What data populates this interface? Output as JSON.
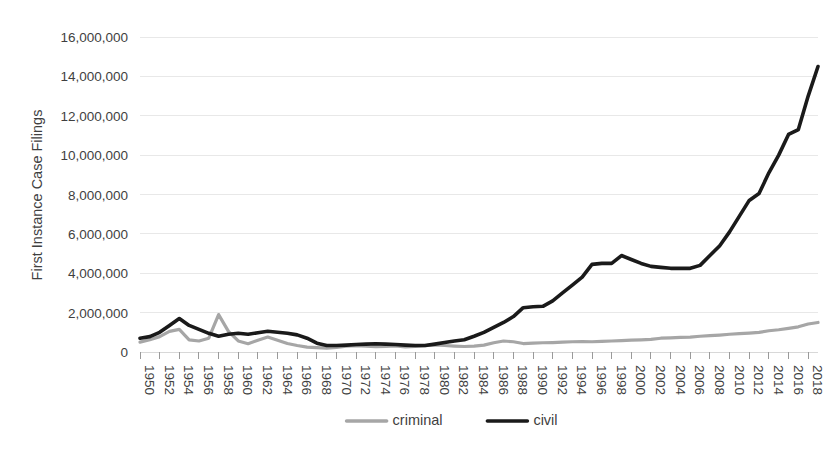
{
  "chart_data": {
    "type": "line",
    "title": "",
    "xlabel": "",
    "ylabel": "First Instance Case Filings",
    "ylim": [
      0,
      16000000
    ],
    "xlim": [
      1950,
      2019
    ],
    "grid": true,
    "legend_position": "bottom",
    "y_ticks": [
      0,
      2000000,
      4000000,
      6000000,
      8000000,
      10000000,
      12000000,
      14000000,
      16000000
    ],
    "y_tick_labels": [
      "0",
      "2,000,000",
      "4,000,000",
      "6,000,000",
      "8,000,000",
      "10,000,000",
      "12,000,000",
      "14,000,000",
      "16,000,000"
    ],
    "x_tick_labels": [
      "1950",
      "1952",
      "1954",
      "1956",
      "1958",
      "1960",
      "1962",
      "1964",
      "1966",
      "1968",
      "1970",
      "1972",
      "1974",
      "1976",
      "1978",
      "1980",
      "1982",
      "1984",
      "1986",
      "1988",
      "1990",
      "1992",
      "1994",
      "1996",
      "1998",
      "2000",
      "2002",
      "2004",
      "2006",
      "2008",
      "2010",
      "2012",
      "2014",
      "2016",
      "2018"
    ],
    "x": [
      1950,
      1951,
      1952,
      1953,
      1954,
      1955,
      1956,
      1957,
      1958,
      1959,
      1960,
      1961,
      1962,
      1963,
      1964,
      1965,
      1966,
      1967,
      1968,
      1969,
      1970,
      1971,
      1972,
      1973,
      1974,
      1975,
      1976,
      1977,
      1978,
      1979,
      1980,
      1981,
      1982,
      1983,
      1984,
      1985,
      1986,
      1987,
      1988,
      1989,
      1990,
      1991,
      1992,
      1993,
      1994,
      1995,
      1996,
      1997,
      1998,
      1999,
      2000,
      2001,
      2002,
      2003,
      2004,
      2005,
      2006,
      2007,
      2008,
      2009,
      2010,
      2011,
      2012,
      2013,
      2014,
      2015,
      2016,
      2017,
      2018,
      2019
    ],
    "series": [
      {
        "name": "criminal",
        "color": "#a6a6a6",
        "width": 3.2,
        "values": [
          500000,
          620000,
          780000,
          1050000,
          1150000,
          620000,
          560000,
          700000,
          1900000,
          1050000,
          560000,
          420000,
          600000,
          760000,
          600000,
          430000,
          330000,
          250000,
          220000,
          200000,
          230000,
          300000,
          320000,
          300000,
          270000,
          290000,
          310000,
          260000,
          290000,
          320000,
          360000,
          330000,
          300000,
          280000,
          300000,
          350000,
          470000,
          560000,
          520000,
          430000,
          450000,
          470000,
          480000,
          500000,
          520000,
          530000,
          520000,
          540000,
          560000,
          580000,
          600000,
          620000,
          640000,
          700000,
          720000,
          740000,
          760000,
          800000,
          830000,
          860000,
          900000,
          930000,
          960000,
          1000000,
          1080000,
          1130000,
          1200000,
          1280000,
          1420000,
          1500000
        ]
      },
      {
        "name": "civil",
        "color": "#1a1a1a",
        "width": 3.6,
        "values": [
          700000,
          780000,
          1000000,
          1350000,
          1700000,
          1350000,
          1150000,
          950000,
          800000,
          900000,
          950000,
          900000,
          980000,
          1050000,
          1000000,
          950000,
          870000,
          700000,
          450000,
          330000,
          330000,
          350000,
          380000,
          400000,
          420000,
          400000,
          380000,
          350000,
          330000,
          330000,
          400000,
          480000,
          560000,
          620000,
          800000,
          1000000,
          1250000,
          1500000,
          1800000,
          2250000,
          2300000,
          2320000,
          2600000,
          3000000,
          3400000,
          3800000,
          4450000,
          4500000,
          4500000,
          4900000,
          4700000,
          4500000,
          4350000,
          4300000,
          4250000,
          4250000,
          4250000,
          4400000,
          4900000,
          5400000,
          6100000,
          6900000,
          7700000,
          8050000,
          9100000,
          10000000,
          11050000,
          11300000,
          13000000,
          14500000
        ]
      }
    ]
  },
  "legend": {
    "items": [
      {
        "label": "criminal",
        "color": "#a6a6a6"
      },
      {
        "label": "civil",
        "color": "#1a1a1a"
      }
    ]
  },
  "axis": {
    "y_title": "First Instance Case Filings"
  }
}
